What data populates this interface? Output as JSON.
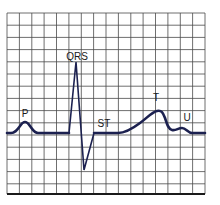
{
  "diagram": {
    "title": "",
    "type": "electrocardiogram waveform",
    "labels": {
      "p": "P",
      "qrs": "QRS",
      "st": "ST",
      "t": "T",
      "u": "U"
    },
    "colors": {
      "trace": "#1c2150",
      "grid": "#4a4a4a",
      "background": "#ffffff"
    },
    "grid": {
      "columns": 16,
      "rows": 15,
      "left": 7,
      "top": 13,
      "right": 205,
      "bottom": 194
    }
  }
}
